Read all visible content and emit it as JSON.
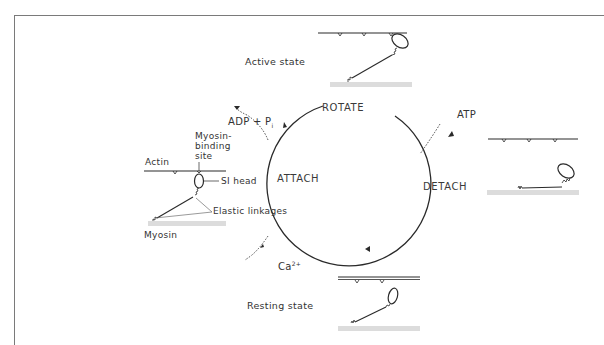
{
  "diagram": {
    "type": "cycle",
    "stages": [
      {
        "id": "rotate",
        "label": "ROTATE"
      },
      {
        "id": "detach",
        "label": "DETACH"
      },
      {
        "id": "attach",
        "label": "ATTACH"
      }
    ],
    "inputs_outputs": {
      "atp": "ATP",
      "adp_pi_main": "ADP + P",
      "adp_pi_sub": "i",
      "ca_main": "Ca",
      "ca_sup": "2+"
    },
    "states": {
      "active": "Active state",
      "resting": "Resting state"
    },
    "annotations": {
      "actin": "Actin",
      "myosin_binding_line1": "Myosin-",
      "myosin_binding_line2": "binding",
      "myosin_binding_line3": "site",
      "s1_head": "SI head",
      "elastic_linkages": "Elastic linkages",
      "myosin": "Myosin"
    },
    "colors": {
      "line": "#2a2a2a",
      "frame": "#7a7a7a",
      "myosin_band": "#d8d8d8"
    }
  }
}
